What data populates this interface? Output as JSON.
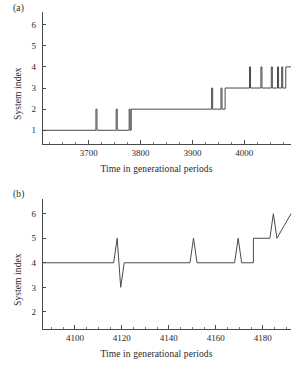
{
  "figure": {
    "background": "#ffffff",
    "line_color": "#4a4a4a",
    "text_color": "#2a2a2a"
  },
  "panels": {
    "a": {
      "tag": "(a)",
      "xlabel": "Time in generational periods",
      "ylabel": "System index"
    },
    "b": {
      "tag": "(b)",
      "xlabel": "Time in generational periods",
      "ylabel": "System index"
    }
  },
  "chart_data": [
    {
      "id": "panel-a",
      "type": "line",
      "title": "(a)",
      "xlabel": "Time in generational periods",
      "ylabel": "System index",
      "xlim": [
        3610,
        4090
      ],
      "ylim": [
        0.35,
        6.6
      ],
      "grid": false,
      "legend": null,
      "xticks": [
        3700,
        3800,
        3900,
        4000
      ],
      "xtick_labels": [
        "3700",
        "3800",
        "3900",
        "4000"
      ],
      "xticks_minor": [
        3625,
        3650,
        3675,
        3725,
        3750,
        3775,
        3825,
        3850,
        3875,
        3925,
        3950,
        3975,
        4025,
        4050,
        4075
      ],
      "yticks": [
        1,
        2,
        3,
        4,
        5,
        6
      ],
      "ytick_labels": [
        "1",
        "2",
        "3",
        "4",
        "5",
        "6"
      ],
      "description": "Step function of system index over time with transient upward spikes.",
      "x": [
        3610,
        3714,
        3714,
        3716,
        3716,
        3753,
        3753,
        3755,
        3755,
        3778,
        3778,
        3780,
        3780,
        3782,
        3782,
        3937,
        3937,
        3939,
        3939,
        3955,
        3955,
        3957,
        3957,
        3963,
        3963,
        4010,
        4010,
        4012,
        4012,
        4032,
        4032,
        4034,
        4034,
        4052,
        4052,
        4054,
        4054,
        4064,
        4064,
        4066,
        4066,
        4072,
        4072,
        4074,
        4074,
        4080,
        4080,
        4090
      ],
      "y": [
        1,
        1,
        2,
        2,
        1,
        1,
        2,
        2,
        1,
        1,
        2,
        2,
        1,
        1,
        2,
        2,
        3,
        3,
        2,
        2,
        3,
        3,
        2,
        2,
        3,
        3,
        4,
        4,
        3,
        3,
        4,
        4,
        3,
        3,
        4,
        4,
        3,
        3,
        4,
        4,
        3,
        3,
        4,
        4,
        3,
        3,
        4,
        4
      ],
      "notes": "Baseline rises 1 -> 2 near t=3782, 2 -> 3 near t=3963, ending level 4 at right edge."
    },
    {
      "id": "panel-b",
      "type": "line",
      "title": "(b)",
      "xlabel": "Time in generational periods",
      "ylabel": "System index",
      "xlim": [
        4086,
        4192
      ],
      "ylim": [
        1.3,
        6.6
      ],
      "grid": false,
      "legend": null,
      "xticks": [
        4100,
        4120,
        4140,
        4160,
        4180
      ],
      "xtick_labels": [
        "4100",
        "4120",
        "4140",
        "4160",
        "4180"
      ],
      "xticks_minor": [
        4090,
        4095,
        4105,
        4110,
        4115,
        4125,
        4130,
        4135,
        4145,
        4150,
        4155,
        4165,
        4170,
        4175,
        4185,
        4190
      ],
      "yticks": [
        2,
        3,
        4,
        5,
        6
      ],
      "ytick_labels": [
        "2",
        "3",
        "4",
        "5",
        "6"
      ],
      "description": "System index held at 4 with sharp transient excursions, stepping up to 6 at the right.",
      "x": [
        4086,
        4116.5,
        4118,
        4119.5,
        4121,
        4149,
        4150.5,
        4152,
        4168,
        4169.5,
        4171,
        4172,
        4176,
        4176,
        4183,
        4184.5,
        4186,
        4192
      ],
      "y": [
        4,
        4,
        5,
        3,
        4,
        4,
        5,
        4,
        4,
        5,
        4,
        4,
        4,
        5,
        5,
        6,
        5,
        6
      ],
      "notes": "Spike up to 5 and down to 3 near t=4118; spike to 5 near t=4150; spike to 5 near t=4169; step to 5 at t=4176; spike 6/5 near t=4185 settling at 6."
    }
  ]
}
